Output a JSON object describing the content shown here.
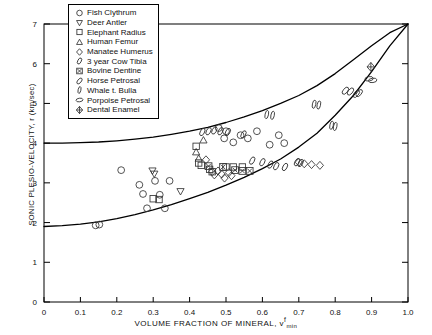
{
  "chart_data": {
    "type": "scatter",
    "title": "",
    "xlabel": "VOLUME FRACTION OF MINERAL, vf_min",
    "xlabel_main": "VOLUME FRACTION OF MINERAL, v",
    "xlabel_sup": "f",
    "xlabel_sub": "min",
    "ylabel": "SONIC PLESIO-VELOCITY, r (km/sec)",
    "xlim": [
      0,
      1.0
    ],
    "ylim": [
      0,
      7
    ],
    "xticks": [
      0,
      0.1,
      0.2,
      0.3,
      0.4,
      0.5,
      0.6,
      0.7,
      0.8,
      0.9,
      1.0
    ],
    "xticklabels": [
      "0",
      "0.1",
      "0.2",
      "0.3",
      "0.4",
      "0.5",
      "0.6",
      "0.7",
      "0.8",
      "0.9",
      "1.0"
    ],
    "yticks": [
      0,
      1,
      2,
      3,
      4,
      5,
      6,
      7
    ],
    "yticklabels": [
      "0",
      "1",
      "2",
      "3",
      "4",
      "5",
      "6",
      "7"
    ],
    "grid": false,
    "legend_position": "top-left",
    "curves": [
      {
        "name": "upper-bound-curve",
        "points": [
          [
            0.0,
            4.0
          ],
          [
            0.05,
            4.0
          ],
          [
            0.1,
            4.01
          ],
          [
            0.15,
            4.03
          ],
          [
            0.2,
            4.06
          ],
          [
            0.25,
            4.1
          ],
          [
            0.3,
            4.15
          ],
          [
            0.35,
            4.22
          ],
          [
            0.4,
            4.3
          ],
          [
            0.45,
            4.4
          ],
          [
            0.5,
            4.52
          ],
          [
            0.55,
            4.66
          ],
          [
            0.6,
            4.82
          ],
          [
            0.65,
            5.0
          ],
          [
            0.7,
            5.2
          ],
          [
            0.75,
            5.45
          ],
          [
            0.8,
            5.75
          ],
          [
            0.85,
            6.1
          ],
          [
            0.9,
            6.45
          ],
          [
            0.95,
            6.78
          ],
          [
            1.0,
            7.0
          ]
        ]
      },
      {
        "name": "lower-bound-curve",
        "points": [
          [
            0.0,
            1.9
          ],
          [
            0.05,
            1.92
          ],
          [
            0.1,
            1.96
          ],
          [
            0.15,
            2.02
          ],
          [
            0.2,
            2.1
          ],
          [
            0.25,
            2.2
          ],
          [
            0.3,
            2.32
          ],
          [
            0.35,
            2.45
          ],
          [
            0.4,
            2.6
          ],
          [
            0.45,
            2.76
          ],
          [
            0.5,
            2.94
          ],
          [
            0.55,
            3.14
          ],
          [
            0.6,
            3.36
          ],
          [
            0.65,
            3.6
          ],
          [
            0.7,
            3.9
          ],
          [
            0.75,
            4.25
          ],
          [
            0.8,
            4.7
          ],
          [
            0.85,
            5.2
          ],
          [
            0.9,
            5.8
          ],
          [
            0.95,
            6.45
          ],
          [
            1.0,
            7.0
          ]
        ]
      }
    ],
    "series": [
      {
        "name": "Fish Clythrum",
        "marker": "circle",
        "points": [
          [
            0.212,
            3.32
          ],
          [
            0.262,
            2.95
          ],
          [
            0.272,
            2.72
          ],
          [
            0.305,
            3.05
          ],
          [
            0.318,
            2.7
          ],
          [
            0.345,
            3.05
          ],
          [
            0.283,
            2.36
          ],
          [
            0.332,
            2.36
          ],
          [
            0.142,
            1.93
          ],
          [
            0.152,
            1.95
          ],
          [
            0.48,
            4.38
          ],
          [
            0.5,
            4.3
          ],
          [
            0.54,
            4.2
          ],
          [
            0.56,
            4.12
          ],
          [
            0.585,
            4.3
          ],
          [
            0.62,
            3.96
          ],
          [
            0.645,
            4.2
          ],
          [
            0.66,
            4.0
          ],
          [
            0.495,
            4.12
          ],
          [
            0.52,
            4.02
          ]
        ]
      },
      {
        "name": "Deer Antler",
        "marker": "triangle-down",
        "points": [
          [
            0.298,
            3.3
          ],
          [
            0.303,
            3.22
          ],
          [
            0.375,
            2.78
          ]
        ]
      },
      {
        "name": "Elephant Radius",
        "marker": "square",
        "points": [
          [
            0.418,
            3.92
          ],
          [
            0.425,
            3.5
          ],
          [
            0.432,
            3.44
          ],
          [
            0.455,
            3.34
          ],
          [
            0.462,
            3.28
          ],
          [
            0.5,
            3.4
          ],
          [
            0.52,
            3.4
          ],
          [
            0.545,
            3.4
          ],
          [
            0.3,
            2.6
          ],
          [
            0.316,
            2.58
          ]
        ]
      },
      {
        "name": "Human Femur",
        "marker": "triangle-up",
        "points": [
          [
            0.418,
            3.78
          ],
          [
            0.425,
            3.62
          ],
          [
            0.438,
            4.08
          ]
        ]
      },
      {
        "name": "Manatee Humerus",
        "marker": "diamond",
        "points": [
          [
            0.445,
            3.58
          ],
          [
            0.462,
            3.28
          ],
          [
            0.468,
            3.2
          ],
          [
            0.478,
            3.3
          ],
          [
            0.488,
            3.22
          ],
          [
            0.496,
            3.12
          ],
          [
            0.508,
            3.26
          ],
          [
            0.515,
            3.18
          ],
          [
            0.7,
            3.52
          ],
          [
            0.715,
            3.48
          ],
          [
            0.735,
            3.46
          ],
          [
            0.758,
            3.44
          ]
        ]
      },
      {
        "name": "3 year Cow Tibia",
        "marker": "ellipse",
        "points": [
          [
            0.435,
            4.28
          ],
          [
            0.452,
            4.3
          ],
          [
            0.468,
            4.32
          ],
          [
            0.485,
            4.3
          ],
          [
            0.505,
            4.28
          ],
          [
            0.548,
            4.22
          ],
          [
            0.572,
            3.56
          ],
          [
            0.6,
            3.52
          ],
          [
            0.622,
            3.46
          ],
          [
            0.638,
            3.42
          ],
          [
            0.662,
            3.4
          ],
          [
            0.695,
            3.52
          ],
          [
            0.705,
            3.5
          ]
        ]
      },
      {
        "name": "Bovine Dentine",
        "marker": "square-x",
        "points": [
          [
            0.452,
            3.42
          ],
          [
            0.492,
            3.4
          ],
          [
            0.525,
            3.32
          ],
          [
            0.545,
            3.3
          ],
          [
            0.565,
            3.3
          ]
        ]
      },
      {
        "name": "Horse Petrosal",
        "marker": "ellipse-tilt",
        "points": [
          [
            0.828,
            5.32
          ],
          [
            0.842,
            5.3
          ],
          [
            0.858,
            5.24
          ],
          [
            0.866,
            5.26
          ]
        ]
      },
      {
        "name": "Whale t. Bulla",
        "marker": "ellipse-narrow",
        "points": [
          [
            0.612,
            4.72
          ],
          [
            0.628,
            4.7
          ],
          [
            0.742,
            4.98
          ],
          [
            0.755,
            4.96
          ],
          [
            0.79,
            4.45
          ],
          [
            0.8,
            4.42
          ]
        ]
      },
      {
        "name": "Porpoise Petrosal",
        "marker": "ellipse-wide",
        "points": [
          [
            0.893,
            5.62
          ],
          [
            0.903,
            5.58
          ]
        ]
      },
      {
        "name": "Dental Enamel",
        "marker": "star-diamond",
        "points": [
          [
            0.898,
            5.92
          ]
        ]
      }
    ]
  },
  "legend": {
    "items": [
      {
        "label": "Fish Clythrum",
        "marker": "circle"
      },
      {
        "label": "Deer Antler",
        "marker": "triangle-down"
      },
      {
        "label": "Elephant Radius",
        "marker": "square"
      },
      {
        "label": "Human Femur",
        "marker": "triangle-up"
      },
      {
        "label": "Manatee Humerus",
        "marker": "diamond"
      },
      {
        "label": "3 year Cow Tibia",
        "marker": "ellipse"
      },
      {
        "label": "Bovine Dentine",
        "marker": "square-x"
      },
      {
        "label": "Horse Petrosal",
        "marker": "ellipse-tilt"
      },
      {
        "label": "Whale t. Bulla",
        "marker": "ellipse-narrow"
      },
      {
        "label": "Porpoise Petrosal",
        "marker": "ellipse-wide"
      },
      {
        "label": "Dental Enamel",
        "marker": "star-diamond"
      }
    ]
  },
  "colors": {
    "axis": "#000000",
    "curve": "#000000",
    "marker": "#333333",
    "background": "#ffffff"
  }
}
